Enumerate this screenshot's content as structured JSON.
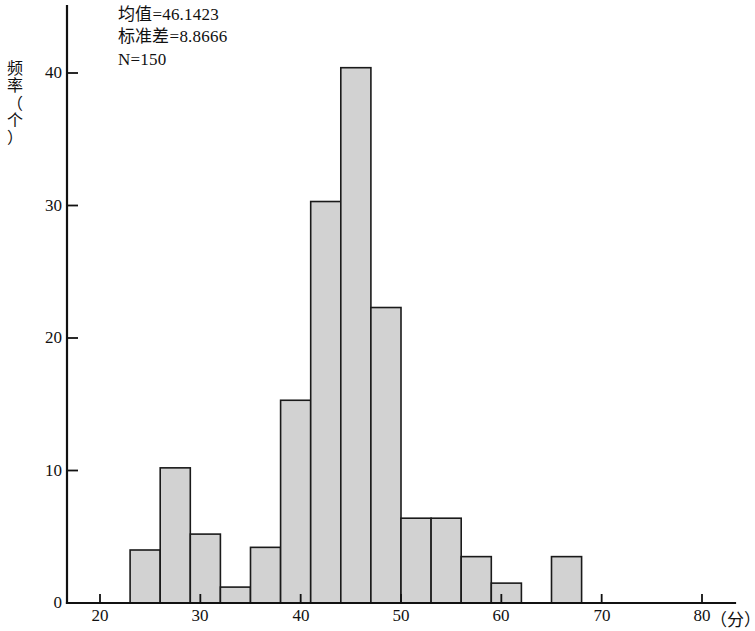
{
  "chart_data": {
    "type": "bar",
    "title": "",
    "subtitle": "",
    "xlabel": "分",
    "ylabel": "频率（个）",
    "xlim": [
      17,
      83
    ],
    "ylim": [
      0,
      42
    ],
    "grid": false,
    "legend": "none",
    "bin_width": 3,
    "x_ticks": [
      20,
      30,
      40,
      50,
      60,
      70,
      80
    ],
    "y_ticks": [
      0,
      10,
      20,
      30,
      40
    ],
    "bins": [
      {
        "start": 23,
        "end": 26,
        "value": 4.0
      },
      {
        "start": 26,
        "end": 29,
        "value": 10.2
      },
      {
        "start": 29,
        "end": 32,
        "value": 5.2
      },
      {
        "start": 32,
        "end": 35,
        "value": 1.2
      },
      {
        "start": 35,
        "end": 38,
        "value": 4.2
      },
      {
        "start": 38,
        "end": 41,
        "value": 15.3
      },
      {
        "start": 41,
        "end": 44,
        "value": 30.3
      },
      {
        "start": 44,
        "end": 47,
        "value": 40.4
      },
      {
        "start": 47,
        "end": 50,
        "value": 22.3
      },
      {
        "start": 50,
        "end": 53,
        "value": 6.4
      },
      {
        "start": 53,
        "end": 56,
        "value": 6.4
      },
      {
        "start": 56,
        "end": 59,
        "value": 3.5
      },
      {
        "start": 59,
        "end": 62,
        "value": 1.5
      },
      {
        "start": 62,
        "end": 65,
        "value": 0
      },
      {
        "start": 65,
        "end": 68,
        "value": 3.5
      }
    ],
    "categories": [
      "23-26",
      "26-29",
      "29-32",
      "32-35",
      "35-38",
      "38-41",
      "41-44",
      "44-47",
      "47-50",
      "50-53",
      "53-56",
      "56-59",
      "59-62",
      "62-65",
      "65-68"
    ],
    "values": [
      4.0,
      10.2,
      5.2,
      1.2,
      4.2,
      15.3,
      30.3,
      40.4,
      22.3,
      6.4,
      6.4,
      3.5,
      1.5,
      0,
      3.5
    ],
    "bar_fill_color": "#d2d2d2",
    "bar_edge_color": "#1a1a1a",
    "annotations": [
      "均值=46.1423",
      "标准差=8.8666",
      "N=150"
    ],
    "statistics": {
      "mean": 46.1423,
      "std_dev": 8.8666,
      "n": 150
    }
  },
  "axis": {
    "y_label_chars": [
      "频",
      "率",
      "（",
      "个",
      "）"
    ],
    "x_unit_text": "（分）"
  }
}
